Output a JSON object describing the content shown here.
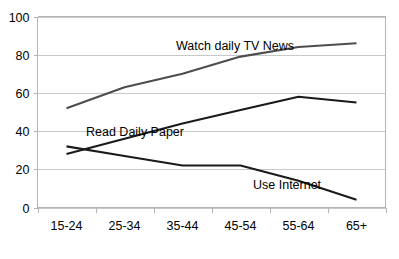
{
  "chart_data": {
    "type": "line",
    "title": "",
    "subtitle": "",
    "xlabel": "",
    "ylabel": "",
    "categories": [
      "15-24",
      "25-34",
      "35-44",
      "45-54",
      "55-64",
      "65+"
    ],
    "ylim": [
      0,
      100
    ],
    "yticks": [
      0,
      20,
      40,
      60,
      80,
      100
    ],
    "grid": "horizontal",
    "legend_position": "inline-annotations",
    "series": [
      {
        "name": "Watch daily TV News",
        "values": [
          52,
          63,
          70,
          79,
          84,
          86
        ],
        "color": "#4d4d4d"
      },
      {
        "name": "Read Daily Paper",
        "values": [
          28,
          36,
          44,
          51,
          58,
          55
        ],
        "color": "#1a1a1a"
      },
      {
        "name": "Use Internet",
        "values": [
          32,
          27,
          22,
          22,
          14,
          4
        ],
        "color": "#1a1a1a"
      }
    ],
    "annotations": [
      {
        "text": "Watch daily TV News",
        "x": 176,
        "y": 50
      },
      {
        "text": "Read Daily Paper",
        "x": 86,
        "y": 136
      },
      {
        "text": "Use Internet",
        "x": 253,
        "y": 189
      }
    ]
  },
  "axis": {
    "y_labels": [
      "100",
      "80",
      "60",
      "40",
      "20",
      "0"
    ],
    "x_labels": [
      "15-24",
      "25-34",
      "35-44",
      "45-54",
      "55-64",
      "65+"
    ]
  },
  "colors": {
    "background": "#ffffff",
    "grid": "#c8c8c8",
    "axis": "#b4b4b4",
    "series_light": "#4d4d4d",
    "series_dark": "#1a1a1a",
    "text": "#000000"
  }
}
